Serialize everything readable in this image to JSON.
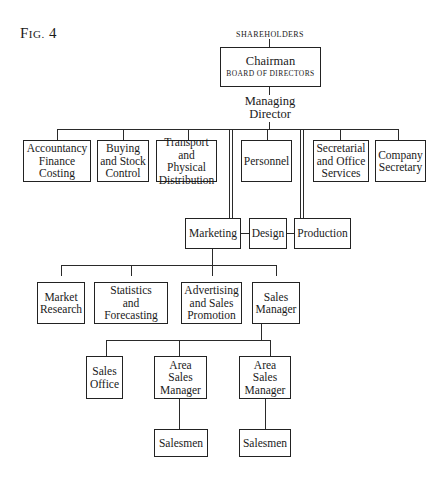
{
  "figure": {
    "label_prefix": "F",
    "label_smallcaps": "IG.",
    "label_number": " 4"
  },
  "chart": {
    "top": {
      "shareholders": "SHAREHOLDERS",
      "chairman_title": "Chairman",
      "chairman_subtitle": "BOARD OF DIRECTORS",
      "managing_director": "Managing\nDirector"
    },
    "directorate_departments": [
      {
        "id": "accountancy",
        "label": "Accountancy\nFinance\nCosting"
      },
      {
        "id": "buying",
        "label": "Buying\nand Stock\nControl"
      },
      {
        "id": "transport",
        "label": "Transport\nand Physical\nDistribution"
      },
      {
        "id": "personnel",
        "label": "Personnel"
      },
      {
        "id": "secretarial",
        "label": "Secretarial\nand Office\nServices"
      },
      {
        "id": "company-secretary",
        "label": "Company\nSecretary"
      }
    ],
    "operations_row": [
      {
        "id": "marketing",
        "label": "Marketing"
      },
      {
        "id": "design",
        "label": "Design"
      },
      {
        "id": "production",
        "label": "Production"
      }
    ],
    "marketing_departments": [
      {
        "id": "market-research",
        "label": "Market\nResearch"
      },
      {
        "id": "statistics",
        "label": "Statistics\nand Forecasting"
      },
      {
        "id": "advertising",
        "label": "Advertising\nand Sales\nPromotion"
      },
      {
        "id": "sales-manager",
        "label": "Sales\nManager"
      }
    ],
    "sales_departments": [
      {
        "id": "sales-office",
        "label": "Sales\nOffice"
      },
      {
        "id": "area-sales-manager-1",
        "label": "Area\nSales\nManager"
      },
      {
        "id": "area-sales-manager-2",
        "label": "Area\nSales\nManager"
      }
    ],
    "field_staff": [
      {
        "id": "salesmen-1",
        "label": "Salesmen"
      },
      {
        "id": "salesmen-2",
        "label": "Salesmen"
      }
    ]
  },
  "colors": {
    "background": "#ffffff",
    "ink": "#1a1a1a"
  }
}
